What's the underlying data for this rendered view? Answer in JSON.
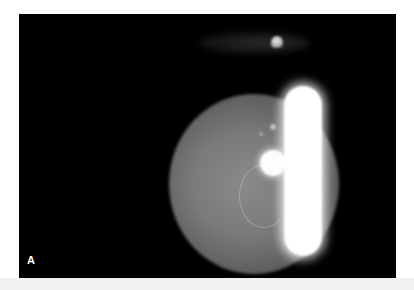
{
  "figure": {
    "panel_label": "A",
    "colors": {
      "background": "#000000",
      "page": "#ffffff",
      "strip": "#f1f1f1",
      "label": "#ffffff"
    }
  }
}
